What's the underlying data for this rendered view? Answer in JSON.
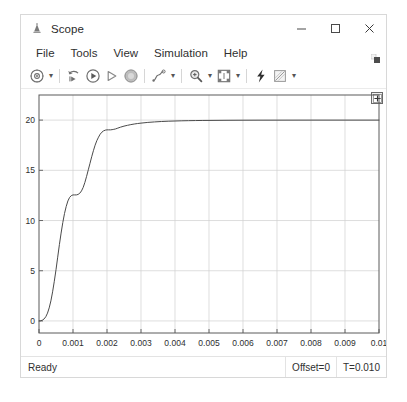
{
  "window": {
    "title": "Scope",
    "title_icon": "scope-icon",
    "controls": {
      "minimize": "minimize-icon",
      "maximize": "maximize-icon",
      "close": "close-icon"
    }
  },
  "menubar": {
    "items": [
      {
        "label": "File"
      },
      {
        "label": "Tools"
      },
      {
        "label": "View"
      },
      {
        "label": "Simulation"
      },
      {
        "label": "Help"
      }
    ],
    "overflow_icon": "menu-overflow-icon"
  },
  "toolbar": {
    "groups": [
      {
        "buttons": [
          {
            "icon": "configuration-properties-icon",
            "caret": true
          }
        ]
      },
      {
        "buttons": [
          {
            "icon": "rewind-to-start-icon",
            "caret": false
          },
          {
            "icon": "run-icon",
            "caret": false
          },
          {
            "icon": "step-forward-icon",
            "caret": false
          },
          {
            "icon": "stop-icon",
            "caret": false
          }
        ]
      },
      {
        "buttons": [
          {
            "icon": "signal-selection-icon",
            "caret": true
          }
        ]
      },
      {
        "buttons": [
          {
            "icon": "zoom-in-icon",
            "caret": true
          },
          {
            "icon": "autoscale-icon",
            "caret": true
          }
        ]
      },
      {
        "buttons": [
          {
            "icon": "highlight-signal-icon",
            "caret": false
          },
          {
            "icon": "measurements-icon",
            "caret": true
          }
        ]
      }
    ]
  },
  "plot": {
    "legend_toggle_icon": "cursor-measurement-icon"
  },
  "statusbar": {
    "state": "Ready",
    "offset": "Offset=0",
    "time": "T=0.010"
  },
  "chart_data": {
    "type": "line",
    "title": "",
    "xlabel": "",
    "ylabel": "",
    "xlim": [
      0,
      0.01
    ],
    "ylim": [
      -1.2,
      22.5
    ],
    "grid": true,
    "legend": "none",
    "line_color": "#4a4a4a",
    "background": "#ffffff",
    "grid_color": "#d0d0d0",
    "xticks": [
      0,
      0.001,
      0.002,
      0.003,
      0.004,
      0.005,
      0.006,
      0.007,
      0.008,
      0.009,
      0.01
    ],
    "xticklabels": [
      "0",
      "0.001",
      "0.002",
      "0.003",
      "0.004",
      "0.005",
      "0.006",
      "0.007",
      "0.008",
      "0.009",
      "0.01"
    ],
    "yticks": [
      0,
      5,
      10,
      15,
      20
    ],
    "yticklabels": [
      "0",
      "5",
      "10",
      "15",
      "20"
    ],
    "series": [
      {
        "name": "signal",
        "x": [
          0,
          5e-05,
          0.0001,
          0.00015,
          0.0002,
          0.00025,
          0.0003,
          0.00035,
          0.0004,
          0.00045,
          0.0005,
          0.00055,
          0.0006,
          0.00065,
          0.0007,
          0.00075,
          0.0008,
          0.00085,
          0.0009,
          0.00095,
          0.001,
          0.00105,
          0.0011,
          0.00115,
          0.0012,
          0.00125,
          0.0013,
          0.00135,
          0.0014,
          0.00145,
          0.0015,
          0.00155,
          0.0016,
          0.00165,
          0.0017,
          0.00175,
          0.0018,
          0.00185,
          0.0019,
          0.00195,
          0.002,
          0.00205,
          0.0021,
          0.00215,
          0.0022,
          0.00225,
          0.0023,
          0.0024,
          0.0025,
          0.0026,
          0.0027,
          0.0028,
          0.0029,
          0.003,
          0.0032,
          0.0034,
          0.0036,
          0.0038,
          0.004,
          0.0042,
          0.0044,
          0.0046,
          0.0048,
          0.005,
          0.0055,
          0.006,
          0.0065,
          0.007,
          0.0075,
          0.008,
          0.0085,
          0.009,
          0.0095,
          0.01
        ],
        "y": [
          0.0,
          0.02,
          0.08,
          0.2,
          0.42,
          0.78,
          1.3,
          2.0,
          2.9,
          3.95,
          5.1,
          6.35,
          7.6,
          8.75,
          9.8,
          10.7,
          11.4,
          11.95,
          12.3,
          12.48,
          12.55,
          12.55,
          12.55,
          12.6,
          12.72,
          12.95,
          13.3,
          13.8,
          14.4,
          15.05,
          15.7,
          16.35,
          16.95,
          17.5,
          17.95,
          18.3,
          18.6,
          18.8,
          18.93,
          19.0,
          19.03,
          19.03,
          19.03,
          19.05,
          19.08,
          19.12,
          19.18,
          19.3,
          19.4,
          19.48,
          19.55,
          19.61,
          19.66,
          19.7,
          19.77,
          19.82,
          19.86,
          19.89,
          19.91,
          19.93,
          19.945,
          19.955,
          19.965,
          19.97,
          19.982,
          19.99,
          19.994,
          19.996,
          19.998,
          19.999,
          20.0,
          20.0,
          20.0,
          20.0
        ]
      }
    ]
  }
}
